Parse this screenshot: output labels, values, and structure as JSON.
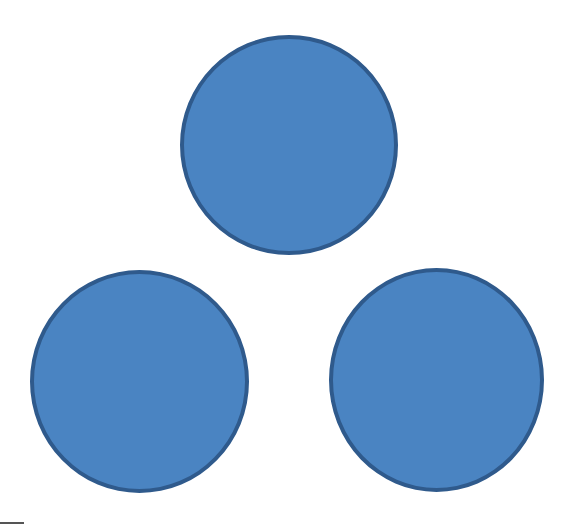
{
  "diagram": {
    "colors": {
      "fill": "#4a84c2",
      "stroke": "#2f5a8c",
      "background": "#ffffff"
    },
    "circles": [
      {
        "id": "top",
        "cx": 289,
        "cy": 145,
        "r": 109
      },
      {
        "id": "bottom-left",
        "cx": 139,
        "cy": 381,
        "r": 111
      },
      {
        "id": "bottom-right",
        "cx": 436,
        "cy": 380,
        "r": 109
      }
    ]
  }
}
